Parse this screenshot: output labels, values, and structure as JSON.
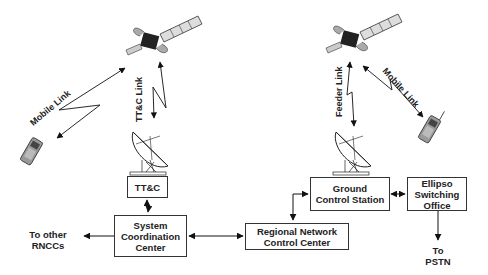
{
  "diagram": {
    "nodes": {
      "ttc": {
        "label": "TT&C"
      },
      "scc": {
        "lines": [
          "System",
          "Coordination",
          "Center"
        ]
      },
      "rncc": {
        "lines": [
          "Regional Network",
          "Control Center"
        ]
      },
      "gcs": {
        "lines": [
          "Ground",
          "Control Station"
        ]
      },
      "eso": {
        "lines": [
          "Ellipso",
          "Switching",
          "Office"
        ]
      }
    },
    "external": {
      "other_rnccs": [
        "To other",
        "RNCCs"
      ],
      "pstn": [
        "To",
        "PSTN"
      ]
    },
    "links": {
      "left_mobile": "Mobile Link",
      "ttc_link": "TT&C Link",
      "feeder": "Feeder Link",
      "right_mobile": "Mobile Link"
    },
    "icons": [
      "satellite-icon",
      "satellite-dish-icon",
      "mobile-phone-icon"
    ],
    "colors": {
      "line": "#111111",
      "box_border": "#333333",
      "background": "#ffffff"
    }
  }
}
